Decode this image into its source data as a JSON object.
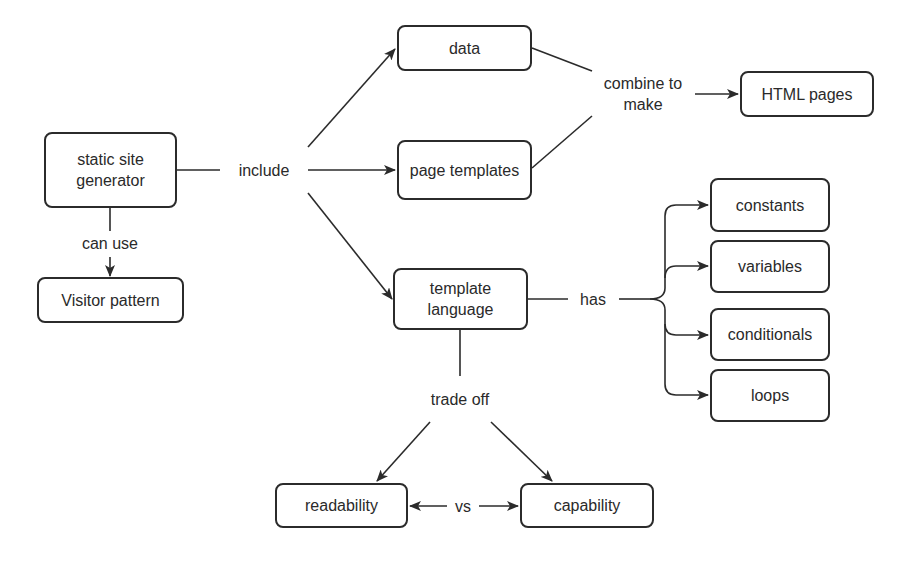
{
  "nodes": {
    "ssg": "static site\ngenerator",
    "visitor": "Visitor pattern",
    "data": "data",
    "page_templates": "page templates",
    "html_pages": "HTML pages",
    "template_language": "template\nlanguage",
    "constants": "constants",
    "variables": "variables",
    "conditionals": "conditionals",
    "loops": "loops",
    "readability": "readability",
    "capability": "capability"
  },
  "edges": {
    "include": "include",
    "can_use": "can use",
    "combine_to_make": "combine to\nmake",
    "has": "has",
    "trade_off": "trade off",
    "vs": "vs"
  },
  "colors": {
    "stroke": "#2b2b2b",
    "text": "#2a2a2a",
    "background": "#ffffff"
  }
}
